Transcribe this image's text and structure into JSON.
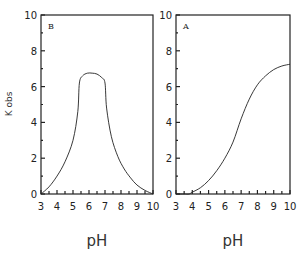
{
  "chart_data": [
    {
      "type": "line",
      "panel_label": "B",
      "title": "",
      "xlabel": "pH",
      "ylabel": "K obs",
      "xlim": [
        3,
        10
      ],
      "ylim": [
        0,
        10
      ],
      "xticks": [
        3,
        4,
        5,
        6,
        7,
        8,
        9,
        10
      ],
      "yticks": [
        0,
        2,
        4,
        6,
        8,
        10
      ],
      "grid": false,
      "series": [
        {
          "name": "B",
          "x": [
            3.0,
            3.5,
            4.0,
            4.5,
            5.0,
            5.3,
            5.4,
            5.6,
            5.9,
            6.2,
            6.5,
            6.8,
            7.0,
            7.1,
            7.4,
            7.8,
            8.2,
            8.6,
            9.0,
            9.5,
            10.0
          ],
          "y": [
            0.0,
            0.4,
            1.0,
            1.8,
            3.0,
            4.6,
            6.2,
            6.6,
            6.75,
            6.75,
            6.7,
            6.5,
            6.2,
            4.8,
            3.2,
            2.1,
            1.4,
            0.9,
            0.5,
            0.2,
            0.0
          ]
        }
      ]
    },
    {
      "type": "line",
      "panel_label": "A",
      "title": "",
      "xlabel": "pH",
      "ylabel": "",
      "xlim": [
        3,
        10
      ],
      "ylim": [
        0,
        10
      ],
      "xticks": [
        3,
        4,
        5,
        6,
        7,
        8,
        9,
        10
      ],
      "yticks": [
        0,
        2,
        4,
        6,
        8,
        10
      ],
      "grid": false,
      "series": [
        {
          "name": "A",
          "x": [
            3.0,
            3.5,
            3.8,
            4.0,
            4.5,
            5.0,
            5.5,
            6.0,
            6.5,
            7.0,
            7.5,
            8.0,
            8.5,
            9.0,
            9.5,
            10.0
          ],
          "y": [
            0.0,
            0.0,
            0.0,
            0.1,
            0.35,
            0.75,
            1.3,
            2.0,
            2.9,
            4.2,
            5.3,
            6.1,
            6.6,
            6.95,
            7.15,
            7.25
          ]
        }
      ]
    }
  ]
}
